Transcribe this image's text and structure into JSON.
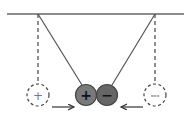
{
  "diagram": {
    "title": "",
    "colors": {
      "line": "#555555",
      "positive_ball_fill": "#7a7a7a",
      "negative_ball_fill": "#666666",
      "ball_stroke": "#444444",
      "dashed": "#444444",
      "background": "#ffffff"
    },
    "ceiling": {
      "label": ""
    },
    "left_initial": {
      "symbol": "+"
    },
    "right_initial": {
      "symbol": "---"
    },
    "positive_ball": {
      "symbol": "+"
    },
    "negative_ball": {
      "symbol": "−"
    },
    "left_arrow": {
      "direction": "right"
    },
    "right_arrow": {
      "direction": "left"
    }
  }
}
